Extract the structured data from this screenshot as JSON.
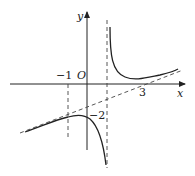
{
  "figure": {
    "type": "function graph with asymptotes",
    "axes": {
      "x_label": "x",
      "y_label": "y",
      "origin_label": "O"
    },
    "tick_labels": {
      "neg_one": "−1",
      "three": "3",
      "neg_two": "−2"
    },
    "asymptotes": {
      "vertical": "x = 1 (dashed)",
      "oblique": "dashed slanted line"
    },
    "guides": [
      "dashed vertical line at x = −1"
    ],
    "colors": {
      "curve": "#222222",
      "axes": "#222222",
      "dashed": "#444444"
    }
  }
}
